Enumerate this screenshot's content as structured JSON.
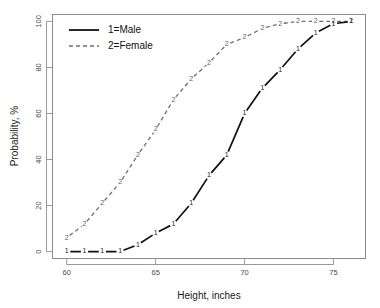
{
  "chart_data": {
    "type": "line",
    "title": "",
    "subtitle": "",
    "xlabel": "Height, inches",
    "ylabel": "Probability, %",
    "xlim": [
      59.2,
      76.8
    ],
    "ylim": [
      -3,
      103
    ],
    "xticks": [
      60,
      65,
      70,
      75
    ],
    "yticks": [
      0,
      20,
      40,
      60,
      80,
      100
    ],
    "xticklabels": [
      "60",
      "65",
      "70",
      "75"
    ],
    "yticklabels": [
      "0",
      "20",
      "40",
      "60",
      "80",
      "100"
    ],
    "grid": false,
    "legend_position": "top-left",
    "x": [
      60,
      61,
      62,
      63,
      64,
      65,
      66,
      67,
      68,
      69,
      70,
      71,
      72,
      73,
      74,
      75,
      76
    ],
    "series": [
      {
        "name": "1=Male",
        "code": "1",
        "style": "solid",
        "color": "#111111",
        "marker": "1",
        "values": [
          0,
          0,
          0,
          0,
          3,
          8,
          12,
          21,
          33,
          42,
          60,
          71,
          79,
          88,
          95,
          99,
          100
        ]
      },
      {
        "name": "2=Female",
        "code": "2",
        "style": "dashed",
        "color": "#6f6f6f",
        "marker": "2",
        "values": [
          6,
          12,
          21,
          30,
          42,
          53,
          66,
          75,
          82,
          90,
          93,
          97,
          99,
          100,
          100,
          100,
          100
        ]
      }
    ]
  },
  "legend": {
    "entries": [
      {
        "label": "1=Male"
      },
      {
        "label": "2=Female"
      }
    ]
  },
  "axes": {
    "x_title": "Height, inches",
    "y_title": "Probability, %"
  }
}
